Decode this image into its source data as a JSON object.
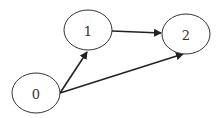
{
  "diagram": {
    "type": "directed-graph",
    "nodes": [
      {
        "id": "0",
        "label": "0",
        "cx": 36,
        "cy": 93,
        "rx": 24,
        "ry": 20
      },
      {
        "id": "1",
        "label": "1",
        "cx": 88,
        "cy": 30,
        "rx": 24,
        "ry": 20
      },
      {
        "id": "2",
        "label": "2",
        "cx": 186,
        "cy": 34,
        "rx": 24,
        "ry": 20
      }
    ],
    "edges": [
      {
        "from": "0",
        "to": "1",
        "x1": 60,
        "y1": 93,
        "x2": 87,
        "y2": 52
      },
      {
        "from": "1",
        "to": "2",
        "x1": 112,
        "y1": 31,
        "x2": 161,
        "y2": 33
      },
      {
        "from": "0",
        "to": "2",
        "x1": 60,
        "y1": 93,
        "x2": 183,
        "y2": 54
      }
    ],
    "colors": {
      "node_stroke": "#333333",
      "edge_stroke": "#222222",
      "background": "#ffffff"
    }
  }
}
